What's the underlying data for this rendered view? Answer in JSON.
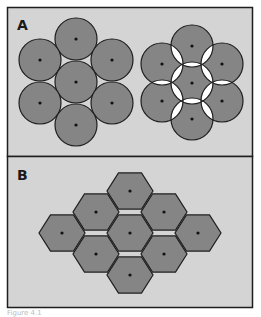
{
  "figure": {
    "panels": [
      {
        "label": "A",
        "description": "Close-packed circles vs overlapping circles",
        "left_cluster": {
          "shape": "circle",
          "radius": 21,
          "centers": [
            [
              76,
              39
            ],
            [
              40,
              60
            ],
            [
              112,
              60
            ],
            [
              76,
              82
            ],
            [
              40,
              103
            ],
            [
              112,
              103
            ],
            [
              76,
              125
            ]
          ]
        },
        "right_cluster": {
          "shape": "circle",
          "radius": 21,
          "centers": [
            [
              192,
              46
            ],
            [
              162,
              64
            ],
            [
              222,
              64
            ],
            [
              192,
              83
            ],
            [
              162,
              101
            ],
            [
              222,
              101
            ],
            [
              192,
              119
            ]
          ]
        }
      },
      {
        "label": "B",
        "description": "Hexagonal tiling",
        "cluster": {
          "shape": "hexagon",
          "radius": 23,
          "centers": [
            [
              130,
              191
            ],
            [
              96,
              212
            ],
            [
              164,
              212
            ],
            [
              62,
              233
            ],
            [
              130,
              233
            ],
            [
              198,
              233
            ],
            [
              96,
              254
            ],
            [
              164,
              254
            ],
            [
              130,
              275
            ]
          ]
        }
      }
    ],
    "caption": "Figure 4.1",
    "colors": {
      "background": "#d4d4d4",
      "fill": "#858585",
      "stroke": "#1e1e1e",
      "dot": "#111111",
      "overlap": "#ffffff"
    }
  }
}
